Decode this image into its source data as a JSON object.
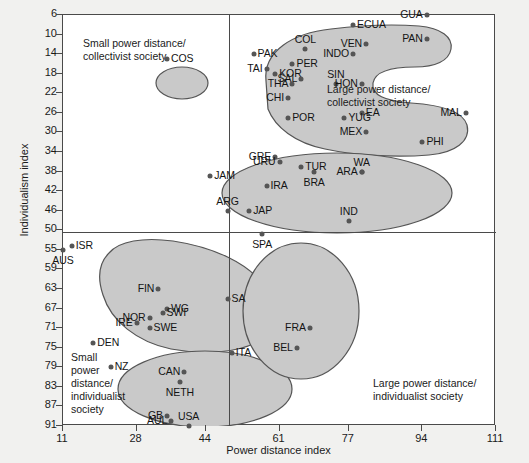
{
  "chart_data": {
    "type": "scatter",
    "title": "",
    "xlabel": "Power distance index",
    "ylabel": "Individualism index",
    "xticks": [
      11,
      28,
      44,
      61,
      77,
      94,
      111
    ],
    "yticks": [
      6,
      10,
      14,
      18,
      22,
      26,
      30,
      34,
      38,
      42,
      46,
      50,
      55,
      59,
      63,
      67,
      71,
      75,
      79,
      83,
      87,
      91
    ],
    "xlim": [
      11,
      111
    ],
    "ylim": [
      6,
      91
    ],
    "y_axis_inverted": true,
    "grid": false,
    "legend": "none",
    "dividers": {
      "vertical_x": 44,
      "horizontal_y": 50
    },
    "quadrant_notes": [
      {
        "id": "top-left",
        "text": "Small power distance/\ncollectivist society"
      },
      {
        "id": "top-right",
        "text": "Large power distance/\ncollectivist society"
      },
      {
        "id": "bottom-left",
        "text": "Small\npower\ndistance/\nindividualist\nsociety"
      },
      {
        "id": "bottom-right",
        "text": "Large power distance/\nindividualist society"
      }
    ],
    "point_fill": "#555555",
    "cluster_fill": "#c9c9c9",
    "cluster_stroke": "#555555",
    "clusters": [
      {
        "name": "small-power-distance-collectivist",
        "labels": [
          "COS"
        ]
      },
      {
        "name": "large-power-distance-collectivist",
        "labels": [
          "PAK",
          "TAI",
          "COL",
          "PER",
          "KOR",
          "INDO",
          "ECUA",
          "GUA",
          "VEN",
          "PAN",
          "SIN",
          "SAL",
          "THA",
          "CHI",
          "WA",
          "HON",
          "POR",
          "EA",
          "YUG",
          "MEX",
          "MAL",
          "PHI"
        ]
      },
      {
        "name": "mid-collectivist",
        "labels": [
          "GRE",
          "URU",
          "JAM",
          "IRA",
          "TUR",
          "BRA",
          "ARA",
          "ARG",
          "JAP",
          "IND"
        ]
      },
      {
        "name": "small-power-distance-individualist-north",
        "labels": [
          "ISR",
          "AUS",
          "FIN",
          "NOR",
          "WG",
          "SWI",
          "IRE",
          "SWE",
          "DEN"
        ]
      },
      {
        "name": "small-power-distance-individualist-south",
        "labels": [
          "NZ",
          "CAN",
          "NETH",
          "GB",
          "USA",
          "AUL"
        ]
      },
      {
        "name": "large-power-distance-individualist",
        "labels": [
          "SPA",
          "SA",
          "FRA",
          "BEL",
          "ITA"
        ]
      }
    ],
    "points": [
      {
        "label": "COS",
        "x": 35,
        "y": 15,
        "pos": "lr"
      },
      {
        "label": "PAK",
        "x": 55,
        "y": 14,
        "pos": "lr"
      },
      {
        "label": "TAI",
        "x": 58,
        "y": 17,
        "pos": "ll"
      },
      {
        "label": "COL",
        "x": 67,
        "y": 13,
        "pos": "top"
      },
      {
        "label": "PER",
        "x": 64,
        "y": 16,
        "pos": "lr"
      },
      {
        "label": "KOR",
        "x": 60,
        "y": 18,
        "pos": "lr"
      },
      {
        "label": "INDO",
        "x": 78,
        "y": 14,
        "pos": "ll"
      },
      {
        "label": "ECUA",
        "x": 78,
        "y": 8,
        "pos": "lr"
      },
      {
        "label": "GUA",
        "x": 95,
        "y": 6,
        "pos": "ll"
      },
      {
        "label": "VEN",
        "x": 81,
        "y": 12,
        "pos": "ll"
      },
      {
        "label": "PAN",
        "x": 95,
        "y": 11,
        "pos": "ll"
      },
      {
        "label": "SIN",
        "x": 74,
        "y": 20,
        "pos": "top"
      },
      {
        "label": "SAL",
        "x": 66,
        "y": 19,
        "pos": "ll"
      },
      {
        "label": "THA",
        "x": 64,
        "y": 20,
        "pos": "ll"
      },
      {
        "label": "CHI",
        "x": 63,
        "y": 23,
        "pos": "ll"
      },
      {
        "label": "WA",
        "x": 80,
        "y": 38,
        "pos": "top"
      },
      {
        "label": "HON",
        "x": 80,
        "y": 20,
        "pos": "ll"
      },
      {
        "label": "POR",
        "x": 63,
        "y": 27,
        "pos": "lr"
      },
      {
        "label": "EA",
        "x": 80,
        "y": 26,
        "pos": "lr"
      },
      {
        "label": "YUG",
        "x": 76,
        "y": 27,
        "pos": "lr"
      },
      {
        "label": "MEX",
        "x": 81,
        "y": 30,
        "pos": "ll"
      },
      {
        "label": "MAL",
        "x": 104,
        "y": 26,
        "pos": "ll"
      },
      {
        "label": "PHI",
        "x": 94,
        "y": 32,
        "pos": "lr"
      },
      {
        "label": "GRE",
        "x": 60,
        "y": 35,
        "pos": "ll"
      },
      {
        "label": "URU",
        "x": 61,
        "y": 36,
        "pos": "ll"
      },
      {
        "label": "JAM",
        "x": 45,
        "y": 39,
        "pos": "lr"
      },
      {
        "label": "IRA",
        "x": 58,
        "y": 41,
        "pos": "lr"
      },
      {
        "label": "TUR",
        "x": 66,
        "y": 37,
        "pos": "lr"
      },
      {
        "label": "BRA",
        "x": 69,
        "y": 38,
        "pos": "bot"
      },
      {
        "label": "ARA",
        "x": 80,
        "y": 38,
        "pos": "ll"
      },
      {
        "label": "ARG",
        "x": 49,
        "y": 46,
        "pos": "top"
      },
      {
        "label": "JAP",
        "x": 54,
        "y": 46,
        "pos": "lr"
      },
      {
        "label": "IND",
        "x": 77,
        "y": 48,
        "pos": "top"
      },
      {
        "label": "ISR",
        "x": 13,
        "y": 54,
        "pos": "lr"
      },
      {
        "label": "AUS",
        "x": 11,
        "y": 55,
        "pos": "bot"
      },
      {
        "label": "FIN",
        "x": 33,
        "y": 63,
        "pos": "ll"
      },
      {
        "label": "WG",
        "x": 35,
        "y": 67,
        "pos": "lr"
      },
      {
        "label": "NOR",
        "x": 31,
        "y": 69,
        "pos": "ll"
      },
      {
        "label": "SWI",
        "x": 34,
        "y": 68,
        "pos": "lr"
      },
      {
        "label": "IRE",
        "x": 28,
        "y": 70,
        "pos": "ll"
      },
      {
        "label": "SWE",
        "x": 31,
        "y": 71,
        "pos": "lr"
      },
      {
        "label": "DEN",
        "x": 18,
        "y": 74,
        "pos": "lr"
      },
      {
        "label": "NZ",
        "x": 22,
        "y": 79,
        "pos": "lr"
      },
      {
        "label": "CAN",
        "x": 39,
        "y": 80,
        "pos": "ll"
      },
      {
        "label": "NETH",
        "x": 38,
        "y": 82,
        "pos": "bot"
      },
      {
        "label": "GB",
        "x": 35,
        "y": 89,
        "pos": "ll"
      },
      {
        "label": "USA",
        "x": 40,
        "y": 91,
        "pos": "top"
      },
      {
        "label": "AUL",
        "x": 36,
        "y": 90,
        "pos": "ll"
      },
      {
        "label": "SPA",
        "x": 57,
        "y": 51,
        "pos": "bot"
      },
      {
        "label": "SA",
        "x": 49,
        "y": 65,
        "pos": "lr"
      },
      {
        "label": "FRA",
        "x": 68,
        "y": 71,
        "pos": "ll"
      },
      {
        "label": "BEL",
        "x": 65,
        "y": 75,
        "pos": "ll"
      },
      {
        "label": "ITA",
        "x": 50,
        "y": 76,
        "pos": "lr"
      }
    ]
  }
}
